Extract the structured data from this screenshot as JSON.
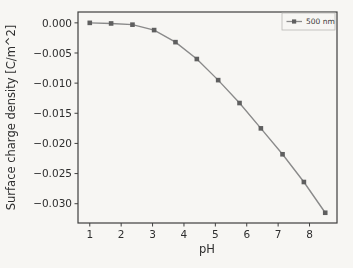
{
  "figure": {
    "background": "#f7f6f3",
    "axis_color": "#3f3f3f",
    "text_color": "#2e2e2e"
  },
  "chart_data": {
    "type": "line",
    "title": "",
    "xlabel": "pH",
    "ylabel": "Surface charge density [C/m^2]",
    "xlim": [
      0.625,
      8.875
    ],
    "ylim": [
      -0.0332,
      0.0018
    ],
    "x_ticks": [
      1,
      2,
      3,
      4,
      5,
      6,
      7,
      8
    ],
    "y_ticks": [
      0,
      -0.005,
      -0.01,
      -0.015,
      -0.02,
      -0.025,
      -0.03
    ],
    "y_tick_labels": [
      "0.000",
      "−0.005",
      "−0.010",
      "−0.015",
      "−0.020",
      "−0.025",
      "−0.030"
    ],
    "grid": false,
    "legend": {
      "position": "upper right",
      "label": "500 nm"
    },
    "series": [
      {
        "name": "500 nm",
        "marker": "square",
        "line_color": "#8a8a8a",
        "marker_color": "#5f5f5f",
        "x": [
          1.0,
          1.68,
          2.36,
          3.05,
          3.73,
          4.41,
          5.09,
          5.77,
          6.45,
          7.14,
          7.82,
          8.5
        ],
        "y": [
          0.0,
          -0.0001,
          -0.0003,
          -0.0012,
          -0.0032,
          -0.006,
          -0.0095,
          -0.0133,
          -0.0175,
          -0.0218,
          -0.0264,
          -0.0315
        ]
      }
    ]
  }
}
